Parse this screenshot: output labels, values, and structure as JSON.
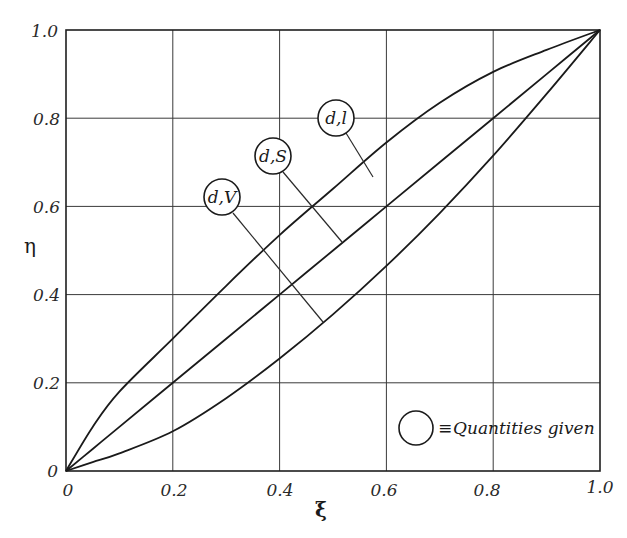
{
  "chart_data": {
    "type": "line",
    "title": "",
    "xlabel": "ξ",
    "ylabel": "η",
    "xlim": [
      0,
      1.0
    ],
    "ylim": [
      0,
      1.0
    ],
    "grid": true,
    "x_ticks": [
      "0",
      "0.2",
      "0.4",
      "0.6",
      "0.8",
      "1.0"
    ],
    "y_ticks": [
      "0",
      "0.2",
      "0.4",
      "0.6",
      "0.8",
      "1.0"
    ],
    "x": [
      0,
      0.05,
      0.1,
      0.2,
      0.3,
      0.4,
      0.5,
      0.6,
      0.7,
      0.8,
      0.9,
      1.0
    ],
    "series": [
      {
        "name": "d,l",
        "values": [
          0,
          0.1,
          0.18,
          0.3,
          0.42,
          0.535,
          0.64,
          0.745,
          0.835,
          0.905,
          0.955,
          1.0
        ]
      },
      {
        "name": "d,S",
        "values": [
          0,
          0.05,
          0.1,
          0.2,
          0.3,
          0.4,
          0.5,
          0.6,
          0.7,
          0.8,
          0.9,
          1.0
        ]
      },
      {
        "name": "d,V",
        "values": [
          0,
          0.02,
          0.04,
          0.09,
          0.165,
          0.255,
          0.355,
          0.465,
          0.585,
          0.715,
          0.855,
          1.0
        ]
      }
    ],
    "annotations": [
      {
        "label": "d,l",
        "target_series": "d,l"
      },
      {
        "label": "d,S",
        "target_series": "d,S"
      },
      {
        "label": "d,V",
        "target_series": "d,V"
      }
    ],
    "legend": {
      "symbol": "circle",
      "text": "≡ Quantities given",
      "position": "lower right"
    }
  },
  "axes": {
    "x_label": "ξ",
    "y_label": "η",
    "x_ticks": [
      "0",
      "0.2",
      "0.4",
      "0.6",
      "0.8",
      "1.0"
    ],
    "y_ticks": [
      "0",
      "0.2",
      "0.4",
      "0.6",
      "0.8",
      "1.0"
    ]
  },
  "callouts": {
    "dl": "d,l",
    "dS": "d,S",
    "dV": "d,V"
  },
  "legend": {
    "equiv": "≡",
    "text": "Quantities given"
  }
}
